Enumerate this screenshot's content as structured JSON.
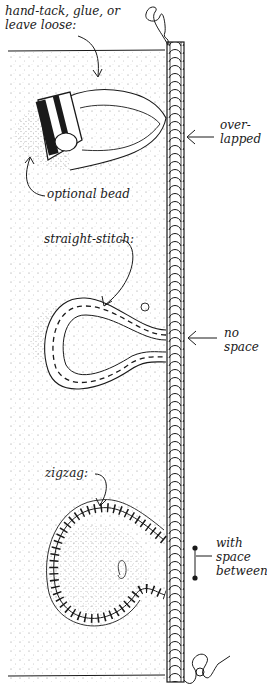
{
  "figure": {
    "colors": {
      "ink": "#1a1a1a",
      "paper": "#ffffff",
      "stipple": "#9a9a9a"
    }
  },
  "labels": {
    "top_note": "hand-tack, glue, or\nleave loose:",
    "bead": "optional bead",
    "overlapped": "over-\nlapped",
    "straight_stitch": "straight-stitch:",
    "no_space": "no\nspace",
    "zigzag": "zigzag:",
    "with_space": "with\nspace\nbetween"
  },
  "sections": [
    {
      "name": "loop-with-bead",
      "method": "hand-tack, glue, or leave loose",
      "join": "over-lapped"
    },
    {
      "name": "straight-stitch-loop",
      "method": "straight-stitch",
      "join": "no space"
    },
    {
      "name": "zigzag-loop",
      "method": "zigzag",
      "join": "with space between"
    }
  ]
}
